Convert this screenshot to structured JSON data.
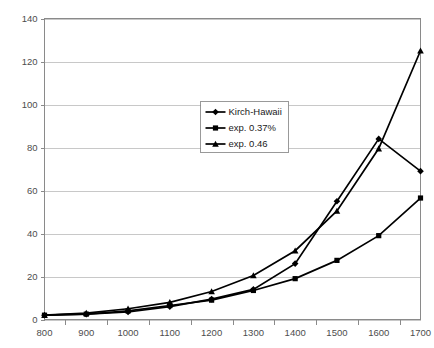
{
  "chart_data": {
    "type": "line",
    "title": "",
    "subtitle": "",
    "xlabel": "",
    "ylabel": "",
    "xlim": [
      800,
      1700
    ],
    "ylim": [
      0,
      140
    ],
    "ytick_step": 20,
    "xtick_step": 100,
    "grid": true,
    "grid_axis": "y",
    "legend_position": "inside-upper-center",
    "x": [
      800,
      900,
      1000,
      1100,
      1200,
      1300,
      1400,
      1500,
      1600,
      1700
    ],
    "categories": [
      "800",
      "900",
      "1000",
      "1100",
      "1200",
      "1300",
      "1400",
      "1500",
      "1600",
      "1700"
    ],
    "xticklabels": [
      "800",
      "900",
      "1000",
      "1100",
      "1200",
      "1300",
      "1400",
      "1500",
      "1600",
      "1700"
    ],
    "yticklabels": [
      "0",
      "20",
      "40",
      "60",
      "80",
      "100",
      "120",
      "140"
    ],
    "yticks": [
      0,
      20,
      40,
      60,
      80,
      100,
      120,
      140
    ],
    "series": [
      {
        "name": "Kirch-Hawaii",
        "marker": "diamond",
        "color": "#000000",
        "values": [
          2,
          2.5,
          3.5,
          6,
          9.5,
          14,
          26,
          55,
          84,
          69
        ]
      },
      {
        "name": "exp. 0.37%",
        "marker": "square",
        "color": "#000000",
        "values": [
          2,
          2.5,
          4,
          6.5,
          9,
          13.5,
          19,
          27.5,
          39,
          56.5
        ]
      },
      {
        "name": "exp. 0.46",
        "marker": "triangle",
        "color": "#000000",
        "values": [
          2,
          3,
          5,
          8,
          13,
          20.5,
          32,
          50.5,
          79.5,
          125
        ]
      }
    ],
    "annotations": []
  },
  "legend": {
    "items": [
      {
        "label": "Kirch-Hawaii",
        "marker": "diamond"
      },
      {
        "label": "exp. 0.37%",
        "marker": "square"
      },
      {
        "label": "exp. 0.46",
        "marker": "triangle"
      }
    ]
  },
  "colors": {
    "background": "#ffffff",
    "series": "#000000",
    "gridline": "#b0b0b0",
    "axis": "#8a8a8a",
    "tick_text": "#4d4d4d",
    "legend_border": "#808080",
    "legend_text": "#1a1a1a"
  }
}
